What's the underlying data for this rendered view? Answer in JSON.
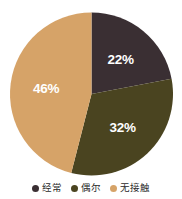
{
  "chart_data": {
    "type": "pie",
    "title": "",
    "subtitle": "",
    "xlabel": "",
    "ylabel": "",
    "grid": false,
    "legend_position": "bottom",
    "categories": [
      "经常",
      "偶尔",
      "无接触"
    ],
    "values": [
      22,
      32,
      46
    ],
    "value_labels": [
      "22%",
      "32%",
      "46%"
    ],
    "colors": [
      "#3a2f33",
      "#4a4420",
      "#d6a368"
    ],
    "start_angle": 0,
    "direction": "clockwise",
    "slices": [
      {
        "label": "经常",
        "value": 22,
        "value_label": "22%",
        "color": "#3a2f33",
        "start_deg": 0,
        "end_deg": 79.2
      },
      {
        "label": "偶尔",
        "value": 32,
        "value_label": "32%",
        "color": "#4a4420",
        "start_deg": 79.2,
        "end_deg": 194.4
      },
      {
        "label": "无接触",
        "value": 46,
        "value_label": "46%",
        "color": "#d6a368",
        "start_deg": 194.4,
        "end_deg": 360
      }
    ]
  },
  "legend": {
    "items": [
      {
        "label": "经常",
        "color": "#3a2f33"
      },
      {
        "label": "偶尔",
        "color": "#4a4420"
      },
      {
        "label": "无接触",
        "color": "#d6a368"
      }
    ]
  },
  "labels": {
    "slice_1": "22%",
    "slice_2": "32%",
    "slice_3": "46%"
  },
  "background_color": "#ffffff"
}
